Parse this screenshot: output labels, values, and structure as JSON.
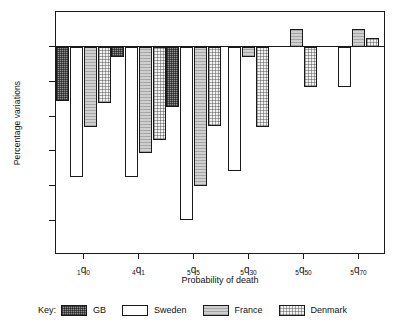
{
  "chart_data": {
    "type": "bar",
    "title": "",
    "xlabel": "Probability of death",
    "ylabel": "Percentage variations",
    "ylim": [
      -60,
      10
    ],
    "yticks": [
      10,
      0,
      -10,
      -20,
      -30,
      -40,
      -50,
      -60
    ],
    "ytick_labels": [
      "10",
      "0",
      "-10",
      "-20",
      "-30",
      "-40",
      "-50",
      "-60"
    ],
    "grid": false,
    "legend_position": "bottom",
    "categories": [
      "1q0",
      "4q1",
      "5q5",
      "5q30",
      "5q50",
      "5q70"
    ],
    "category_labels": [
      {
        "pre": "1",
        "q": "q",
        "post": "0"
      },
      {
        "pre": "4",
        "q": "q",
        "post": "1"
      },
      {
        "pre": "5",
        "q": "q",
        "post": "5"
      },
      {
        "pre": "5",
        "q": "q",
        "post": "30"
      },
      {
        "pre": "5",
        "q": "q",
        "post": "50"
      },
      {
        "pre": "5",
        "q": "q",
        "post": "70"
      }
    ],
    "series": [
      {
        "name": "GB",
        "key": "gb",
        "values": [
          -15.5,
          -3.0,
          -17.5,
          null,
          null,
          null
        ]
      },
      {
        "name": "Sweden",
        "key": "sweden",
        "values": [
          -37.5,
          -37.5,
          -50.0,
          -35.8,
          null,
          -11.5
        ]
      },
      {
        "name": "France",
        "key": "france",
        "values": [
          -23.0,
          -30.5,
          -40.0,
          -3.0,
          5.0,
          5.0
        ]
      },
      {
        "name": "Denmark",
        "key": "denmark",
        "values": [
          -16.2,
          -27.0,
          -22.8,
          -23.0,
          -11.5,
          2.5
        ]
      }
    ]
  },
  "legend": {
    "key_label": "Key:",
    "entries": [
      {
        "label": "GB",
        "key": "gb"
      },
      {
        "label": "Sweden",
        "key": "sweden"
      },
      {
        "label": "France",
        "key": "france"
      },
      {
        "label": "Denmark",
        "key": "denmark"
      }
    ]
  },
  "colors": {
    "axis": "#1a1a1a",
    "gb": "#8e8e8e",
    "sweden": "#ffffff",
    "france": "#cfcfcf",
    "denmark": "#f2f2f2"
  }
}
